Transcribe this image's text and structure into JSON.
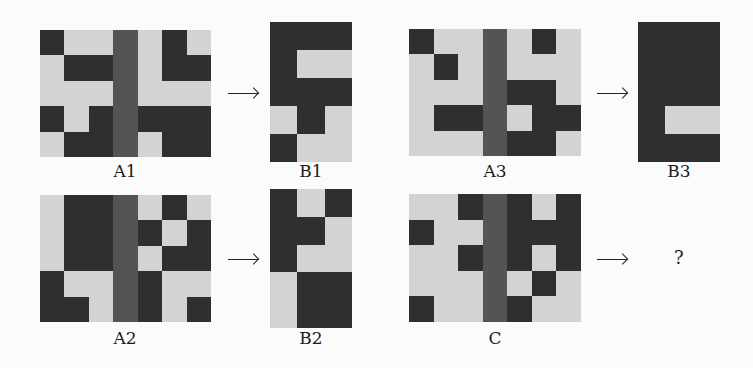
{
  "colors": {
    "light": "#d3d3d3",
    "dark": "#2f2f2f",
    "mid": "#545454",
    "background": "#fbfbfb"
  },
  "legend": {
    "L": "light cell",
    "D": "dark cell",
    "M": "middle divider column"
  },
  "pairs": [
    {
      "input": {
        "label": "A1",
        "rows": [
          [
            "D",
            "L",
            "L",
            "M",
            "L",
            "D",
            "L"
          ],
          [
            "L",
            "D",
            "D",
            "M",
            "L",
            "D",
            "D"
          ],
          [
            "L",
            "L",
            "L",
            "M",
            "L",
            "L",
            "L"
          ],
          [
            "D",
            "L",
            "D",
            "M",
            "D",
            "D",
            "D"
          ],
          [
            "L",
            "D",
            "D",
            "M",
            "L",
            "D",
            "D"
          ]
        ]
      },
      "output": {
        "label": "B1",
        "rows": [
          [
            "D",
            "D",
            "D"
          ],
          [
            "D",
            "L",
            "L"
          ],
          [
            "D",
            "D",
            "D"
          ],
          [
            "L",
            "D",
            "L"
          ],
          [
            "D",
            "L",
            "L"
          ]
        ]
      }
    },
    {
      "input": {
        "label": "A2",
        "rows": [
          [
            "L",
            "D",
            "D",
            "M",
            "L",
            "D",
            "L"
          ],
          [
            "L",
            "D",
            "D",
            "M",
            "D",
            "L",
            "D"
          ],
          [
            "L",
            "D",
            "D",
            "M",
            "L",
            "D",
            "D"
          ],
          [
            "D",
            "L",
            "L",
            "M",
            "D",
            "L",
            "L"
          ],
          [
            "D",
            "D",
            "L",
            "M",
            "D",
            "L",
            "D"
          ]
        ]
      },
      "output": {
        "label": "B2",
        "rows": [
          [
            "D",
            "L",
            "D"
          ],
          [
            "D",
            "D",
            "L"
          ],
          [
            "D",
            "L",
            "L"
          ],
          [
            "L",
            "D",
            "D"
          ],
          [
            "L",
            "D",
            "D"
          ]
        ]
      }
    },
    {
      "input": {
        "label": "A3",
        "rows": [
          [
            "D",
            "L",
            "L",
            "M",
            "L",
            "D",
            "L"
          ],
          [
            "L",
            "D",
            "L",
            "M",
            "L",
            "L",
            "L"
          ],
          [
            "L",
            "L",
            "L",
            "M",
            "D",
            "D",
            "L"
          ],
          [
            "L",
            "D",
            "D",
            "M",
            "L",
            "D",
            "D"
          ],
          [
            "L",
            "L",
            "L",
            "M",
            "D",
            "D",
            "L"
          ]
        ]
      },
      "output": {
        "label": "B3",
        "rows": [
          [
            "D",
            "D",
            "D"
          ],
          [
            "D",
            "D",
            "D"
          ],
          [
            "D",
            "D",
            "D"
          ],
          [
            "D",
            "L",
            "L"
          ],
          [
            "D",
            "D",
            "D"
          ]
        ]
      }
    }
  ],
  "test": {
    "input": {
      "label": "C",
      "rows": [
        [
          "L",
          "L",
          "D",
          "M",
          "D",
          "L",
          "D"
        ],
        [
          "D",
          "L",
          "L",
          "M",
          "D",
          "D",
          "D"
        ],
        [
          "L",
          "L",
          "D",
          "M",
          "D",
          "L",
          "D"
        ],
        [
          "L",
          "L",
          "L",
          "M",
          "L",
          "D",
          "L"
        ],
        [
          "D",
          "L",
          "L",
          "M",
          "D",
          "L",
          "L"
        ]
      ]
    },
    "output_placeholder": "?"
  },
  "arrow_symbol": "→"
}
